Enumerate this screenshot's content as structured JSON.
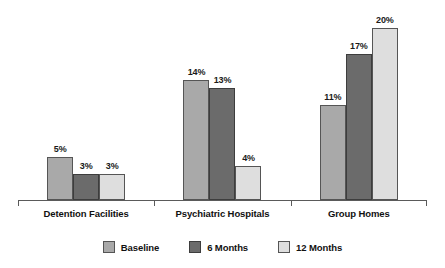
{
  "chart_data": {
    "type": "bar",
    "title": "",
    "subtitle": "",
    "xlabel": "",
    "ylabel": "",
    "ylim": [
      0,
      22
    ],
    "grid": false,
    "legend_position": "bottom",
    "value_suffix": "%",
    "categories": [
      "Detention Facilities",
      "Psychiatric Hospitals",
      "Group Homes"
    ],
    "series": [
      {
        "name": "Baseline",
        "color": "#a9a9a9",
        "values": [
          5,
          14,
          11
        ],
        "labels": [
          "5%",
          "14%",
          "11%"
        ]
      },
      {
        "name": "6 Months",
        "color": "#6b6b6b",
        "values": [
          3,
          13,
          17
        ],
        "labels": [
          "3%",
          "13%",
          "17%"
        ]
      },
      {
        "name": "12 Months",
        "color": "#dedede",
        "values": [
          3,
          4,
          20
        ],
        "labels": [
          "3%",
          "4%",
          "20%"
        ]
      }
    ]
  },
  "axis": {
    "baseline_color": "#5a5a5a",
    "tick_left": "",
    "tick_divider_1": "",
    "tick_divider_2": "",
    "tick_right": ""
  }
}
